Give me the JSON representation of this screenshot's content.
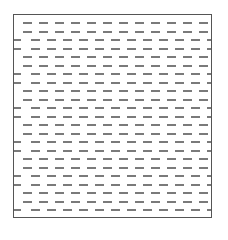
{
  "figure": {
    "border_color": "#555555",
    "dash_color": "#7a7a7a",
    "background": "#ffffff",
    "rows": 24,
    "row_spacing_px": 8.5,
    "first_row_y_px": 7,
    "dash_period_px": 16,
    "dash_length_px": 9,
    "pattern": [
      "A",
      "A",
      "B",
      "B"
    ],
    "offset_A_px": 9,
    "offset_B_px": 1
  }
}
